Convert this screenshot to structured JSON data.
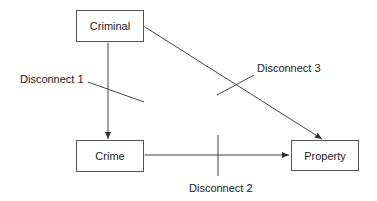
{
  "nodes": {
    "criminal": {
      "label": "Criminal"
    },
    "crime": {
      "label": "Crime"
    },
    "property": {
      "label": "Property"
    }
  },
  "disconnects": [
    {
      "label": "Disconnect 1",
      "between": [
        "Criminal",
        "Crime"
      ]
    },
    {
      "label": "Disconnect 2",
      "between": [
        "Crime",
        "Property"
      ]
    },
    {
      "label": "Disconnect 3",
      "between": [
        "Criminal",
        "Property"
      ]
    }
  ],
  "colors": {
    "line": "#444444",
    "box_border": "#555555",
    "text": "#222222"
  }
}
